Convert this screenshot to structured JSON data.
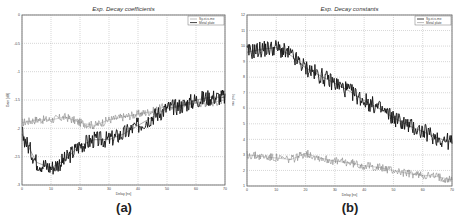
{
  "chart_data": [
    {
      "type": "line",
      "panel": "(a)",
      "title": "Exp. Decay coefficients",
      "xlabel": "Delay [ns]",
      "ylabel": "Gain [dB]",
      "xlim": [
        0,
        70
      ],
      "ylim": [
        -3,
        0
      ],
      "xticks": [
        0,
        10,
        20,
        30,
        40,
        50,
        60,
        70
      ],
      "yticks": [
        0,
        -0.5,
        -1,
        -1.5,
        -2,
        -2.5,
        -3
      ],
      "grid": true,
      "legend_position": "upper right",
      "x": [
        0,
        5,
        10,
        15,
        20,
        25,
        30,
        35,
        40,
        45,
        50,
        55,
        60,
        65,
        70
      ],
      "series": [
        {
          "name": "Sy-st-s-me",
          "style": "gray thin",
          "values": [
            -1.9,
            -1.85,
            -1.85,
            -1.8,
            -1.9,
            -1.95,
            -1.85,
            -1.8,
            -1.75,
            -1.7,
            -1.6,
            -1.6,
            -1.55,
            -1.55,
            -1.5
          ]
        },
        {
          "name": "Metal plate",
          "style": "black thick",
          "values": [
            -2.1,
            -2.6,
            -2.7,
            -2.55,
            -2.3,
            -2.2,
            -2.2,
            -2.1,
            -1.95,
            -1.8,
            -1.65,
            -1.6,
            -1.5,
            -1.45,
            -1.45
          ]
        }
      ]
    },
    {
      "type": "line",
      "panel": "(b)",
      "title": "Exp. Decay constants",
      "xlabel": "Delay [ns]",
      "ylabel": "Tau [ns]",
      "xlim": [
        0,
        70
      ],
      "ylim": [
        1,
        12
      ],
      "xticks": [
        0,
        10,
        20,
        30,
        40,
        50,
        60,
        70
      ],
      "yticks": [
        12,
        11,
        10,
        9,
        8,
        7,
        6,
        5,
        4,
        3,
        2,
        1
      ],
      "grid": true,
      "legend_position": "upper right",
      "x": [
        0,
        5,
        10,
        15,
        20,
        25,
        30,
        35,
        40,
        45,
        50,
        55,
        60,
        65,
        70
      ],
      "series": [
        {
          "name": "Sy-st-s-me",
          "style": "black thick",
          "values": [
            9.6,
            9.8,
            9.9,
            9.4,
            8.6,
            8.1,
            7.6,
            7.1,
            6.5,
            6.0,
            5.4,
            4.9,
            4.5,
            4.1,
            3.8
          ]
        },
        {
          "name": "Metal plate",
          "style": "gray thin",
          "values": [
            3.0,
            2.9,
            2.8,
            2.7,
            3.1,
            2.8,
            2.6,
            2.5,
            2.3,
            2.2,
            2.0,
            1.8,
            1.7,
            1.6,
            1.4
          ]
        }
      ]
    }
  ],
  "captions": {
    "a": "(a)",
    "b": "(b)"
  },
  "legend": {
    "a": [
      "Sy-st-s-me",
      "Metal plate"
    ],
    "b": [
      "Sy-st-s-me",
      "Metal plate"
    ]
  },
  "titles": {
    "a": "Exp. Decay coefficients",
    "b": "Exp. Decay constants"
  },
  "axes": {
    "a": {
      "xlabel": "Delay [ns]",
      "ylabel": "Gain [dB]",
      "xticks": [
        "0",
        "10",
        "20",
        "30",
        "40",
        "50",
        "60",
        "70"
      ],
      "yticks": [
        "0",
        "-0.5",
        "-1",
        "-1.5",
        "-2",
        "-2.5",
        "-3"
      ]
    },
    "b": {
      "xlabel": "Delay [ns]",
      "ylabel": "Tau [ns]",
      "xticks": [
        "0",
        "10",
        "20",
        "30",
        "40",
        "50",
        "60",
        "70"
      ],
      "yticks": [
        "12",
        "11",
        "10",
        "9",
        "8",
        "7",
        "6",
        "5",
        "4",
        "3",
        "2",
        "1"
      ]
    }
  }
}
